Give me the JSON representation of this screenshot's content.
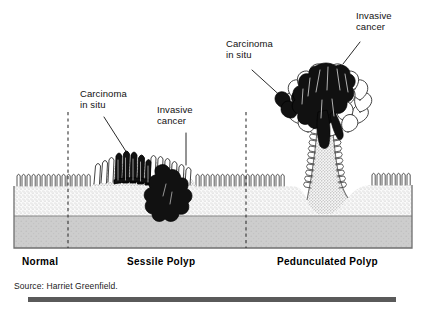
{
  "figure": {
    "background_color": "#ffffff",
    "annotations": [
      {
        "id": "carcinoma-in-situ-left",
        "text_line1": "Carcinoma",
        "text_line2": "in situ",
        "x": 80,
        "y": 92
      },
      {
        "id": "invasive-cancer-left",
        "text_line1": "Invasive",
        "text_line2": "cancer",
        "x": 157,
        "y": 108
      },
      {
        "id": "carcinoma-in-situ-right",
        "text_line1": "Carcinoma",
        "text_line2": "in situ",
        "x": 226,
        "y": 42
      },
      {
        "id": "invasive-cancer-right",
        "text_line1": "Invasive",
        "text_line2": "cancer",
        "x": 356,
        "y": 14
      }
    ],
    "zone_labels": [
      {
        "id": "zone-normal",
        "text": "Normal",
        "x": 22,
        "y": 258
      },
      {
        "id": "zone-sessile",
        "text": "Sessile Polyp",
        "x": 127,
        "y": 258
      },
      {
        "id": "zone-pedunculated",
        "text": "Pedunculated Polyp",
        "x": 277,
        "y": 258
      }
    ],
    "source": {
      "text": "Source: Harriet Greenfield.",
      "x": 14,
      "y": 283
    },
    "tissue": {
      "mucosa_fill": "#f2f2f2",
      "submucosa_fill": "#e8e8e8",
      "muscularis_fill": "#c9c9c9",
      "outline": "#6b6b6b",
      "carcinoma_fill": "#111111",
      "left_edge": 14,
      "right_edge": 412,
      "surface_y": 186,
      "muscularis_y": 216,
      "bottom_y": 248
    },
    "dividers": [
      {
        "id": "divider-normal-sessile",
        "x": 68
      },
      {
        "id": "divider-sessile-pedunculated",
        "x": 246
      }
    ],
    "bottom_rule": {
      "color": "#5a5a5a",
      "x": 28,
      "y": 297,
      "width": 368,
      "height": 5
    }
  }
}
